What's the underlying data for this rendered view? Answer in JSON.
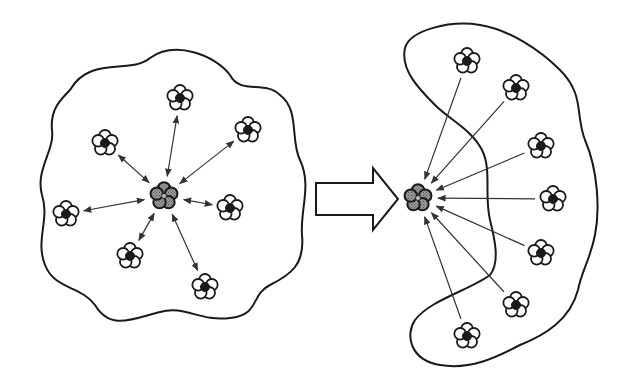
{
  "diagram": {
    "colors": {
      "background": "#ffffff",
      "stroke": "#1a1a1a",
      "outer_cell_fill": "#ffffff",
      "cluster_core_fill": "#1a1a1a",
      "central_cell_fill": "#8a8a8a",
      "arrow": "#333333"
    },
    "left_panel": {
      "boundary_shape": "wavy-blob",
      "central_cluster": {
        "x": 164,
        "y": 196,
        "style": "gray-filled"
      },
      "arrow_type": "bidirectional",
      "peripheral_clusters": [
        {
          "x": 180,
          "y": 98
        },
        {
          "x": 105,
          "y": 143
        },
        {
          "x": 248,
          "y": 130
        },
        {
          "x": 66,
          "y": 214
        },
        {
          "x": 230,
          "y": 208
        },
        {
          "x": 130,
          "y": 256
        },
        {
          "x": 205,
          "y": 287
        }
      ]
    },
    "transition_arrow": {
      "type": "block-arrow-right",
      "x1": 315,
      "x2": 398,
      "y": 200
    },
    "right_panel": {
      "boundary_shape": "c-shaped-bean",
      "central_cluster": {
        "x": 418,
        "y": 198,
        "style": "gray-filled"
      },
      "arrow_type": "unidirectional-inward",
      "peripheral_clusters": [
        {
          "x": 467,
          "y": 61
        },
        {
          "x": 516,
          "y": 88
        },
        {
          "x": 541,
          "y": 146
        },
        {
          "x": 553,
          "y": 199
        },
        {
          "x": 541,
          "y": 253
        },
        {
          "x": 516,
          "y": 305
        },
        {
          "x": 467,
          "y": 336
        }
      ]
    }
  }
}
